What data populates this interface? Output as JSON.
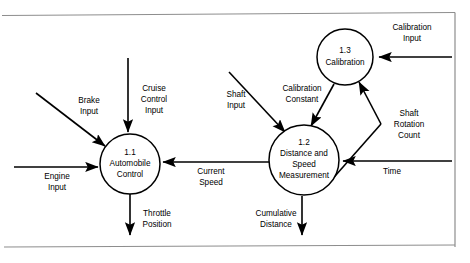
{
  "diagram": {
    "type": "data-flow-diagram",
    "frame": {
      "top_border_y": 15,
      "bottom_border_y": 247,
      "right_border_x": 455,
      "border_color": "#8d8d8d"
    },
    "processes": [
      {
        "id": "1.1",
        "number": "1.1",
        "name_lines": [
          "Automobile",
          "Control"
        ],
        "cx": 130,
        "cy": 164,
        "r": 30
      },
      {
        "id": "1.2",
        "number": "1.2",
        "name_lines": [
          "Distance and",
          "Speed",
          "Measurement"
        ],
        "cx": 304,
        "cy": 160,
        "r": 35
      },
      {
        "id": "1.3",
        "number": "1.3",
        "name_lines": [
          "Calibration"
        ],
        "cx": 345,
        "cy": 57,
        "r": 28
      }
    ],
    "flows": [
      {
        "id": "brake-input",
        "label_lines": [
          "Brake",
          "Input"
        ],
        "from": "external",
        "to": "1.1"
      },
      {
        "id": "cruise-control-input",
        "label_lines": [
          "Cruise",
          "Control",
          "Input"
        ],
        "from": "external",
        "to": "1.1"
      },
      {
        "id": "engine-input",
        "label_lines": [
          "Engine",
          "Input"
        ],
        "from": "external",
        "to": "1.1"
      },
      {
        "id": "throttle-position",
        "label_lines": [
          "Throttle",
          "Position"
        ],
        "from": "1.1",
        "to": "external"
      },
      {
        "id": "current-speed",
        "label_lines": [
          "Current",
          "Speed"
        ],
        "from": "1.2",
        "to": "1.1"
      },
      {
        "id": "shaft-input",
        "label_lines": [
          "Shaft",
          "Input"
        ],
        "from": "external",
        "to": "1.2"
      },
      {
        "id": "calibration-constant",
        "label_lines": [
          "Calibration",
          "Constant"
        ],
        "from": "1.3",
        "to": "1.2"
      },
      {
        "id": "shaft-rotation-count",
        "label_lines": [
          "Shaft",
          "Rotation",
          "Count"
        ],
        "from": "1.2",
        "to": "1.3"
      },
      {
        "id": "calibration-input",
        "label_lines": [
          "Calibration",
          "Input"
        ],
        "from": "external",
        "to": "1.3"
      },
      {
        "id": "time",
        "label_lines": [
          "Time"
        ],
        "from": "external",
        "to": "1.2"
      },
      {
        "id": "cumulative-distance",
        "label_lines": [
          "Cumulative",
          "Distance"
        ],
        "from": "1.2",
        "to": "external"
      }
    ],
    "labels": {
      "brake_input_l1": "Brake",
      "brake_input_l2": "Input",
      "cruise_l1": "Cruise",
      "cruise_l2": "Control",
      "cruise_l3": "Input",
      "engine_l1": "Engine",
      "engine_l2": "Input",
      "throttle_l1": "Throttle",
      "throttle_l2": "Position",
      "current_speed_l1": "Current",
      "current_speed_l2": "Speed",
      "shaft_input_l1": "Shaft",
      "shaft_input_l2": "Input",
      "calib_const_l1": "Calibration",
      "calib_const_l2": "Constant",
      "shaft_rot_l1": "Shaft",
      "shaft_rot_l2": "Rotation",
      "shaft_rot_l3": "Count",
      "calib_input_l1": "Calibration",
      "calib_input_l2": "Input",
      "time_l1": "Time",
      "cumulative_l1": "Cumulative",
      "cumulative_l2": "Distance",
      "p11_num": "1.1",
      "p11_l1": "Automobile",
      "p11_l2": "Control",
      "p12_num": "1.2",
      "p12_l1": "Distance and",
      "p12_l2": "Speed",
      "p12_l3": "Measurement",
      "p13_num": "1.3",
      "p13_l1": "Calibration"
    }
  }
}
